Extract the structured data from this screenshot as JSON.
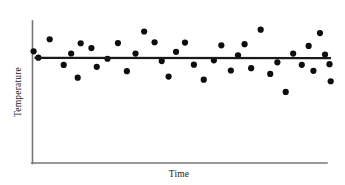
{
  "figure": {
    "title": "",
    "background_color": "#ffffff"
  },
  "chart_data": {
    "type": "scatter",
    "title": "",
    "subtitle": "",
    "xlabel": "Time",
    "ylabel": "Temperature",
    "xlim": [
      0,
      100
    ],
    "ylim": [
      0,
      100
    ],
    "grid": false,
    "legend": null,
    "xticks": [],
    "yticks": [],
    "xticklabels": [],
    "yticklabels": [],
    "annotations": [],
    "series": [
      {
        "name": "observations",
        "type": "scatter",
        "marker": "circle",
        "marker_size": 3.1,
        "color": "#0d0d0d",
        "points": [
          [
            0.2,
            65.9
          ],
          [
            1.8,
            58.8
          ],
          [
            5.6,
            79.5
          ],
          [
            10.3,
            50.7
          ],
          [
            12.8,
            63.5
          ],
          [
            15.0,
            36.3
          ],
          [
            16.0,
            75.0
          ],
          [
            19.6,
            69.6
          ],
          [
            21.4,
            48.5
          ],
          [
            25.0,
            57.6
          ],
          [
            28.5,
            75.2
          ],
          [
            31.5,
            43.6
          ],
          [
            34.4,
            63.4
          ],
          [
            37.3,
            88.2
          ],
          [
            40.8,
            76.1
          ],
          [
            43.2,
            55.0
          ],
          [
            45.5,
            37.6
          ],
          [
            48.0,
            65.4
          ],
          [
            51.0,
            75.8
          ],
          [
            54.0,
            50.9
          ],
          [
            57.3,
            34.1
          ],
          [
            60.7,
            55.8
          ],
          [
            63.2,
            72.7
          ],
          [
            66.4,
            44.4
          ],
          [
            68.8,
            61.5
          ],
          [
            71.0,
            74.0
          ],
          [
            73.2,
            47.0
          ],
          [
            76.4,
            90.2
          ],
          [
            79.6,
            40.5
          ],
          [
            82.0,
            53.6
          ],
          [
            84.8,
            20.3
          ],
          [
            87.3,
            63.4
          ],
          [
            90.2,
            50.8
          ],
          [
            92.5,
            72.0
          ],
          [
            94.1,
            44.0
          ],
          [
            96.3,
            86.4
          ],
          [
            98.0,
            62.3
          ],
          [
            99.5,
            51.5
          ],
          [
            99.9,
            32.3
          ]
        ]
      }
    ],
    "trendline": {
      "name": "regression-line",
      "type": "line",
      "color": "#1a1a1a",
      "slope": -0.003,
      "intercept": 58.6,
      "start": [
        0.5,
        58.6
      ],
      "end": [
        100.0,
        58.3
      ],
      "description": "flat horizontal trend showing no relationship"
    },
    "axes": {
      "x_axis_line": {
        "from": [
          0,
          0
        ],
        "to": [
          100,
          0
        ]
      },
      "y_axis_line": {
        "from": [
          0,
          0
        ],
        "to": [
          0,
          100
        ]
      },
      "color": "#777777",
      "spines": [
        "left",
        "bottom"
      ]
    }
  }
}
